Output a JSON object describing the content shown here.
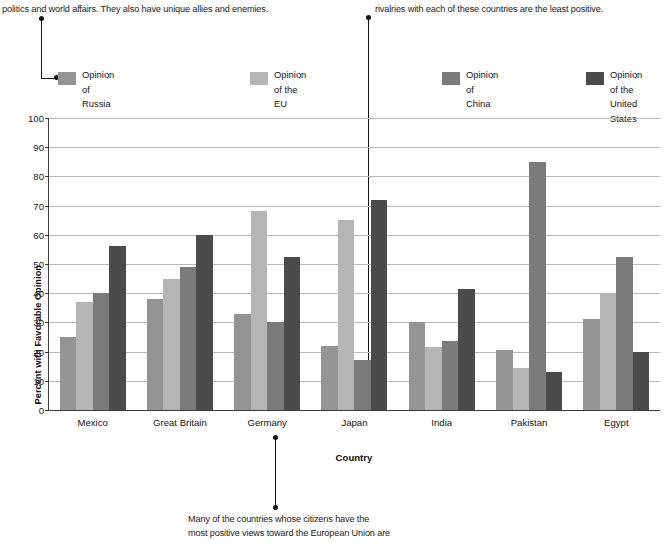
{
  "annotations": {
    "top_left": "politics and world affairs. They also have unique allies and enemies.",
    "top_right": "rivalries with each of these countries are the least positive.",
    "bottom_line1": "Many of the countries whose citizens have the",
    "bottom_line2": "most positive views toward the European Union are"
  },
  "legend": {
    "items": [
      {
        "label": "Opinion of\nRussia",
        "color": "#949494"
      },
      {
        "label": "Opinion\nof the EU",
        "color": "#b5b5b5"
      },
      {
        "label": "Opinion of\nChina",
        "color": "#7b7b7b"
      },
      {
        "label": "Opinion of the\nUnited States",
        "color": "#4b4b4b"
      }
    ]
  },
  "chart_data": {
    "type": "bar",
    "title": "",
    "xlabel": "Country",
    "ylabel": "Percent with Favorable Opinion",
    "ylim": [
      0,
      100
    ],
    "ytick_step": 10,
    "yticks": [
      0,
      10,
      20,
      30,
      40,
      50,
      60,
      70,
      80,
      90,
      100
    ],
    "grid": true,
    "legend_position": "top",
    "categories": [
      "Mexico",
      "Great Britain",
      "Germany",
      "Japan",
      "India",
      "Pakistan",
      "Egypt"
    ],
    "series": [
      {
        "name": "Opinion of Russia",
        "color": "#949494",
        "values": [
          25,
          38,
          33,
          22,
          30,
          20.5,
          31
        ]
      },
      {
        "name": "Opinion of the EU",
        "color": "#b5b5b5",
        "values": [
          37,
          45,
          68,
          65,
          21.5,
          14.5,
          40
        ]
      },
      {
        "name": "Opinion of China",
        "color": "#7b7b7b",
        "values": [
          40,
          49,
          30,
          17,
          23.5,
          85,
          52.5
        ]
      },
      {
        "name": "Opinion of the United States",
        "color": "#4b4b4b",
        "values": [
          56,
          60,
          52.5,
          72,
          41.5,
          13,
          20
        ]
      }
    ]
  }
}
